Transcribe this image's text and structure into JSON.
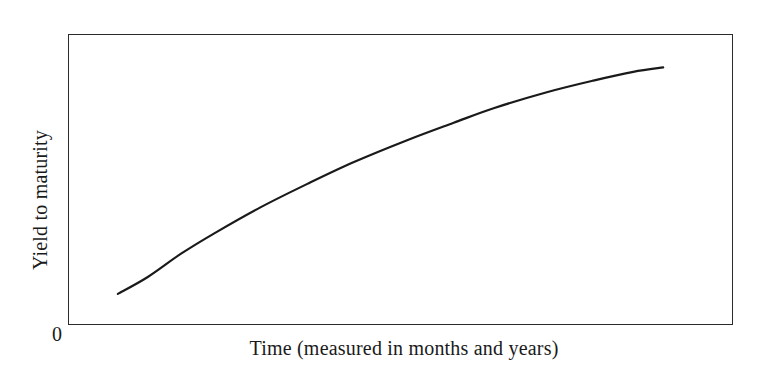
{
  "figure": {
    "background_color": "#ffffff",
    "frame_color": "#2b2b2b",
    "curve_color": "#1a1a1a"
  },
  "labels": {
    "origin": "0",
    "y_axis": "Yield to maturity",
    "x_axis": "Time (measured in months and years)"
  },
  "chart_data": {
    "type": "line",
    "title": "",
    "subtitle": "",
    "xlabel": "Time (measured in months and years)",
    "ylabel": "Yield to maturity",
    "legend": [],
    "legend_position": "none",
    "grid": false,
    "axis_style": "box-frame",
    "origin_tick_label": "0",
    "xlim": [
      0,
      100
    ],
    "ylim": [
      0,
      100
    ],
    "x_tick_labels": [],
    "y_tick_labels": [],
    "annotations": [],
    "series": [
      {
        "name": "Yield curve",
        "shape": "concave-increasing (upward sloping, flattening)",
        "color": "#1a1a1a",
        "line_width": 2.2,
        "x": [
          7.5,
          12,
          17,
          22,
          29,
          36,
          43,
          51,
          58,
          64,
          72,
          79,
          85,
          89.5
        ],
        "y": [
          10.7,
          16.5,
          24.5,
          31.5,
          40.5,
          48.5,
          56.0,
          63.5,
          69.5,
          74.5,
          80.0,
          84.0,
          87.0,
          88.5
        ]
      }
    ]
  }
}
